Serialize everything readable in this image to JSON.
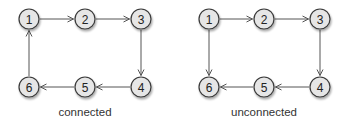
{
  "colors": {
    "node_fill": "#e6e6e6",
    "node_stroke": "#3a3a3a",
    "edge": "#555555",
    "shadow": "#bdbdbd",
    "text": "#222222"
  },
  "graphs": [
    {
      "caption": "connected",
      "caption_pos": [
        85,
        116
      ],
      "nodes": [
        {
          "id": "1",
          "label": "1",
          "x": 29,
          "y": 19
        },
        {
          "id": "2",
          "label": "2",
          "x": 85,
          "y": 19
        },
        {
          "id": "3",
          "label": "3",
          "x": 141,
          "y": 19
        },
        {
          "id": "4",
          "label": "4",
          "x": 141,
          "y": 87
        },
        {
          "id": "5",
          "label": "5",
          "x": 85,
          "y": 87
        },
        {
          "id": "6",
          "label": "6",
          "x": 29,
          "y": 87
        }
      ],
      "edges": [
        {
          "from": "1",
          "to": "2"
        },
        {
          "from": "2",
          "to": "3"
        },
        {
          "from": "3",
          "to": "4"
        },
        {
          "from": "4",
          "to": "5"
        },
        {
          "from": "5",
          "to": "6"
        },
        {
          "from": "6",
          "to": "1"
        }
      ]
    },
    {
      "caption": "unconnected",
      "caption_pos": [
        264,
        116
      ],
      "nodes": [
        {
          "id": "1",
          "label": "1",
          "x": 209,
          "y": 19
        },
        {
          "id": "2",
          "label": "2",
          "x": 264,
          "y": 19
        },
        {
          "id": "3",
          "label": "3",
          "x": 320,
          "y": 19
        },
        {
          "id": "4",
          "label": "4",
          "x": 320,
          "y": 87
        },
        {
          "id": "5",
          "label": "5",
          "x": 264,
          "y": 87
        },
        {
          "id": "6",
          "label": "6",
          "x": 209,
          "y": 87
        }
      ],
      "edges": [
        {
          "from": "1",
          "to": "2"
        },
        {
          "from": "2",
          "to": "3"
        },
        {
          "from": "3",
          "to": "4"
        },
        {
          "from": "4",
          "to": "5"
        },
        {
          "from": "5",
          "to": "6"
        },
        {
          "from": "1",
          "to": "6"
        }
      ]
    }
  ]
}
